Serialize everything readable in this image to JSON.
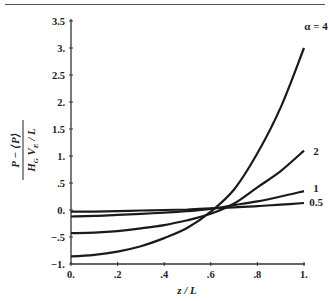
{
  "chart_data": {
    "type": "line",
    "title": "",
    "xlabel": "z / L",
    "ylabel": {
      "numerator": "P − ⟨P⟩",
      "denominator": "H_G V_E / L"
    },
    "xlim": [
      0,
      1
    ],
    "ylim": [
      -1,
      3.5
    ],
    "grid": false,
    "x_ticks": [
      {
        "value": 0,
        "label": "0."
      },
      {
        "value": 0.2,
        "label": ".2"
      },
      {
        "value": 0.4,
        "label": ".4"
      },
      {
        "value": 0.6,
        "label": ".6"
      },
      {
        "value": 0.8,
        "label": ".8"
      },
      {
        "value": 1,
        "label": "1."
      }
    ],
    "y_ticks": [
      {
        "value": -1,
        "label": "-1."
      },
      {
        "value": -0.5,
        "label": "-.5"
      },
      {
        "value": 0,
        "label": "0."
      },
      {
        "value": 0.5,
        "label": ".5"
      },
      {
        "value": 1,
        "label": "1."
      },
      {
        "value": 1.5,
        "label": "1.5"
      },
      {
        "value": 2,
        "label": "2."
      },
      {
        "value": 2.5,
        "label": "2.5"
      },
      {
        "value": 3,
        "label": "3."
      },
      {
        "value": 3.5,
        "label": "3.5"
      }
    ],
    "x": [
      0,
      0.1,
      0.2,
      0.3,
      0.4,
      0.5,
      0.6,
      0.7,
      0.8,
      0.9,
      1.0
    ],
    "series": [
      {
        "name": "α = 4",
        "label": "α = 4",
        "values": [
          -0.86,
          -0.83,
          -0.77,
          -0.67,
          -0.52,
          -0.33,
          -0.03,
          0.38,
          1.05,
          1.9,
          3.0
        ]
      },
      {
        "name": "2",
        "label": "2",
        "values": [
          -0.43,
          -0.42,
          -0.39,
          -0.34,
          -0.28,
          -0.19,
          -0.07,
          0.12,
          0.42,
          0.72,
          1.1
        ]
      },
      {
        "name": "1",
        "label": "1",
        "values": [
          -0.12,
          -0.11,
          -0.09,
          -0.07,
          -0.05,
          -0.02,
          0.02,
          0.09,
          0.16,
          0.25,
          0.35
        ]
      },
      {
        "name": "0.5",
        "label": "0.5",
        "values": [
          -0.03,
          -0.03,
          -0.02,
          -0.01,
          0.0,
          0.01,
          0.03,
          0.05,
          0.07,
          0.1,
          0.13
        ]
      }
    ],
    "legend_position": "inline-right"
  }
}
